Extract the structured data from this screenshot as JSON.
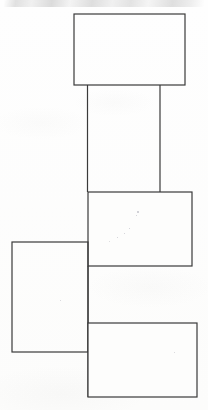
{
  "document": {
    "kind": "scanned-line-drawing",
    "title": "Block Diagram of Connected Rectangles",
    "background_color": "#fdfdfc",
    "stroke_color": "#3a3a3a",
    "stroke_width": 1.2,
    "width": 208,
    "height": 410,
    "visible_text": "",
    "notes": "No legible text is present in the scan; only line-work and faint scanner artifacts."
  },
  "figure": {
    "shapes": [
      {
        "id": "top-block",
        "name": "top-rectangle",
        "type": "rect",
        "x": 74,
        "y": 14,
        "width": 111,
        "height": 71,
        "label": ""
      },
      {
        "id": "middle-block",
        "name": "middle-rectangle",
        "type": "rect",
        "x": 88,
        "y": 192,
        "width": 104,
        "height": 74,
        "label": ""
      },
      {
        "id": "left-block",
        "name": "left-rectangle",
        "type": "rect",
        "x": 12,
        "y": 242,
        "width": 76,
        "height": 110,
        "label": ""
      },
      {
        "id": "bottom-block",
        "name": "bottom-rectangle",
        "type": "rect",
        "x": 88,
        "y": 323,
        "width": 109,
        "height": 74,
        "label": ""
      }
    ],
    "connectors": [
      {
        "id": "connector-left",
        "name": "left-vertical-connector",
        "type": "line",
        "x1": 87.5,
        "y1": 85,
        "x2": 87.5,
        "y2": 192,
        "label": ""
      },
      {
        "id": "connector-right",
        "name": "right-vertical-connector",
        "type": "line",
        "x1": 160,
        "y1": 85,
        "x2": 160,
        "y2": 192,
        "label": ""
      },
      {
        "id": "connector-spine",
        "name": "lower-spine-connector",
        "type": "line",
        "x1": 88,
        "y1": 266,
        "x2": 88,
        "y2": 397,
        "label": ""
      }
    ],
    "specks": [
      {
        "x": 137,
        "y": 211,
        "size": 1.6
      },
      {
        "x": 136,
        "y": 215,
        "size": 1.2
      },
      {
        "x": 129,
        "y": 228,
        "size": 1.4
      },
      {
        "x": 124,
        "y": 233,
        "size": 1.1
      },
      {
        "x": 117,
        "y": 237,
        "size": 1.0
      },
      {
        "x": 109,
        "y": 241,
        "size": 0.9
      },
      {
        "x": 60,
        "y": 300,
        "size": 0.8
      },
      {
        "x": 174,
        "y": 352,
        "size": 0.8
      }
    ]
  }
}
